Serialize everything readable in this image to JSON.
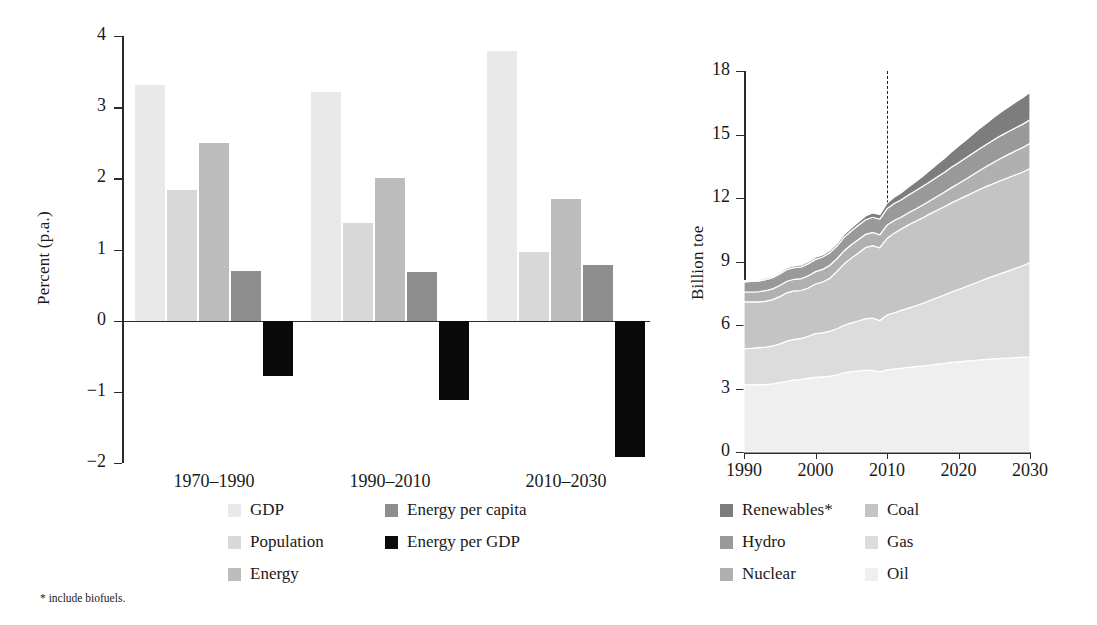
{
  "figure": {
    "footnote": "* include biofuels."
  },
  "left_panel": {
    "ylabel": "Percent (p.a.)",
    "yticks": [
      "4",
      "3",
      "2",
      "1",
      "0",
      "−1",
      "−2"
    ],
    "xticks": [
      "1970–1990",
      "1990–2010",
      "2010–2030"
    ],
    "legend": [
      {
        "label": "GDP",
        "color": "#e9e9e9"
      },
      {
        "label": "Population",
        "color": "#d8d8d8"
      },
      {
        "label": "Energy",
        "color": "#bcbcbc"
      },
      {
        "label": "Energy per capita",
        "color": "#8e8e8e"
      },
      {
        "label": "Energy per GDP",
        "color": "#0a0a0a"
      }
    ]
  },
  "right_panel": {
    "ylabel": "Billion toe",
    "yticks": [
      "18",
      "15",
      "12",
      "9",
      "6",
      "3",
      "0"
    ],
    "xticks": [
      "1990",
      "2000",
      "2010",
      "2020",
      "2030"
    ],
    "divider_year": "2010",
    "legend": [
      {
        "label": "Renewables*",
        "color": "#7d7d7d"
      },
      {
        "label": "Hydro",
        "color": "#999999"
      },
      {
        "label": "Nuclear",
        "color": "#b0b0b0"
      },
      {
        "label": "Coal",
        "color": "#c4c4c4"
      },
      {
        "label": "Gas",
        "color": "#dcdcdc"
      },
      {
        "label": "Oil",
        "color": "#efefef"
      }
    ]
  },
  "chart_data": [
    {
      "type": "bar",
      "id": "growth-drivers",
      "title": "",
      "xlabel": "",
      "ylabel": "Percent (p.a.)",
      "categories": [
        "1970–1990",
        "1990–2010",
        "2010–2030"
      ],
      "ylim": [
        -2,
        4
      ],
      "ytick_values": [
        4,
        3,
        2,
        1,
        0,
        -1,
        -2
      ],
      "grid": false,
      "legend_position": "below",
      "series": [
        {
          "name": "GDP",
          "color": "#e9e9e9",
          "values": [
            3.31,
            3.21,
            3.79
          ]
        },
        {
          "name": "Population",
          "color": "#d8d8d8",
          "values": [
            1.83,
            1.37,
            0.96
          ]
        },
        {
          "name": "Energy",
          "color": "#bcbcbc",
          "values": [
            2.5,
            2.01,
            1.71
          ]
        },
        {
          "name": "Energy per capita",
          "color": "#8e8e8e",
          "values": [
            0.7,
            0.68,
            0.78
          ]
        },
        {
          "name": "Energy per GDP",
          "color": "#0a0a0a",
          "values": [
            -0.78,
            -1.11,
            -1.91
          ]
        }
      ]
    },
    {
      "type": "area",
      "id": "primary-energy-mix",
      "title": "",
      "xlabel": "",
      "ylabel": "Billion toe",
      "stacked": true,
      "xlim": [
        1990,
        2030
      ],
      "ylim": [
        0,
        18
      ],
      "ytick_values": [
        0,
        3,
        6,
        9,
        12,
        15,
        18
      ],
      "xtick_values": [
        1990,
        2000,
        2010,
        2020,
        2030
      ],
      "grid": false,
      "legend_position": "below",
      "annotations": [
        {
          "type": "vline",
          "x": 2010,
          "style": "dashed",
          "label": "2010"
        }
      ],
      "x": [
        1990,
        1991,
        1992,
        1993,
        1994,
        1995,
        1996,
        1997,
        1998,
        1999,
        2000,
        2001,
        2002,
        2003,
        2004,
        2005,
        2006,
        2007,
        2008,
        2009,
        2010,
        2011,
        2012,
        2013,
        2014,
        2015,
        2016,
        2017,
        2018,
        2019,
        2020,
        2021,
        2022,
        2023,
        2024,
        2025,
        2026,
        2027,
        2028,
        2029,
        2030
      ],
      "series": [
        {
          "name": "Oil",
          "color": "#efefef",
          "values": [
            3.18,
            3.17,
            3.19,
            3.18,
            3.22,
            3.28,
            3.34,
            3.41,
            3.43,
            3.49,
            3.53,
            3.55,
            3.58,
            3.64,
            3.75,
            3.8,
            3.83,
            3.87,
            3.85,
            3.79,
            3.88,
            3.92,
            3.96,
            4.0,
            4.03,
            4.07,
            4.11,
            4.15,
            4.19,
            4.23,
            4.26,
            4.29,
            4.32,
            4.35,
            4.38,
            4.4,
            4.42,
            4.44,
            4.46,
            4.48,
            4.5
          ]
        },
        {
          "name": "Gas",
          "color": "#dcdcdc",
          "values": [
            1.7,
            1.73,
            1.74,
            1.77,
            1.79,
            1.83,
            1.9,
            1.91,
            1.94,
            1.98,
            2.06,
            2.08,
            2.13,
            2.18,
            2.24,
            2.3,
            2.36,
            2.43,
            2.47,
            2.42,
            2.59,
            2.66,
            2.73,
            2.8,
            2.88,
            2.96,
            3.05,
            3.14,
            3.23,
            3.33,
            3.42,
            3.52,
            3.62,
            3.72,
            3.82,
            3.92,
            4.02,
            4.12,
            4.22,
            4.32,
            4.45
          ]
        },
        {
          "name": "Coal",
          "color": "#c4c4c4",
          "values": [
            2.22,
            2.19,
            2.16,
            2.17,
            2.19,
            2.23,
            2.28,
            2.29,
            2.26,
            2.28,
            2.35,
            2.4,
            2.5,
            2.71,
            2.9,
            3.06,
            3.21,
            3.36,
            3.43,
            3.44,
            3.62,
            3.76,
            3.85,
            3.93,
            3.99,
            4.04,
            4.09,
            4.13,
            4.17,
            4.21,
            4.25,
            4.28,
            4.31,
            4.34,
            4.36,
            4.38,
            4.4,
            4.41,
            4.42,
            4.43,
            4.44
          ]
        },
        {
          "name": "Nuclear",
          "color": "#b0b0b0",
          "values": [
            0.45,
            0.47,
            0.48,
            0.5,
            0.51,
            0.53,
            0.55,
            0.55,
            0.56,
            0.58,
            0.58,
            0.6,
            0.61,
            0.6,
            0.62,
            0.63,
            0.64,
            0.62,
            0.62,
            0.61,
            0.63,
            0.6,
            0.56,
            0.57,
            0.58,
            0.6,
            0.62,
            0.65,
            0.68,
            0.72,
            0.76,
            0.8,
            0.85,
            0.9,
            0.95,
            1.0,
            1.05,
            1.09,
            1.13,
            1.16,
            1.2
          ]
        },
        {
          "name": "Hydro",
          "color": "#999999",
          "values": [
            0.49,
            0.5,
            0.5,
            0.52,
            0.52,
            0.54,
            0.55,
            0.55,
            0.56,
            0.57,
            0.58,
            0.58,
            0.59,
            0.6,
            0.63,
            0.65,
            0.67,
            0.69,
            0.72,
            0.74,
            0.78,
            0.8,
            0.82,
            0.84,
            0.86,
            0.88,
            0.9,
            0.92,
            0.94,
            0.96,
            0.98,
            1.0,
            1.01,
            1.03,
            1.04,
            1.06,
            1.07,
            1.08,
            1.09,
            1.1,
            1.11
          ]
        },
        {
          "name": "Renewables*",
          "color": "#7d7d7d",
          "values": [
            0.06,
            0.06,
            0.06,
            0.07,
            0.07,
            0.07,
            0.08,
            0.08,
            0.09,
            0.09,
            0.1,
            0.1,
            0.11,
            0.12,
            0.13,
            0.14,
            0.16,
            0.18,
            0.2,
            0.22,
            0.25,
            0.29,
            0.33,
            0.38,
            0.43,
            0.48,
            0.54,
            0.6,
            0.66,
            0.72,
            0.78,
            0.84,
            0.9,
            0.96,
            1.01,
            1.06,
            1.11,
            1.16,
            1.21,
            1.26,
            1.3
          ]
        }
      ]
    }
  ]
}
